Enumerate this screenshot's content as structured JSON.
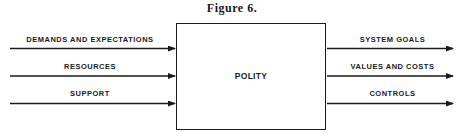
{
  "figure": {
    "title": "Figure 6.",
    "center_box": {
      "label": "POLITY"
    },
    "inputs": [
      {
        "label": "DEMANDS AND EXPECTATIONS"
      },
      {
        "label": "RESOURCES"
      },
      {
        "label": "SUPPORT"
      }
    ],
    "outputs": [
      {
        "label": "SYSTEM GOALS"
      },
      {
        "label": "VALUES AND COSTS"
      },
      {
        "label": "CONTROLS"
      }
    ],
    "colors": {
      "line": "#1a1a1a",
      "background": "#ffffff"
    }
  }
}
